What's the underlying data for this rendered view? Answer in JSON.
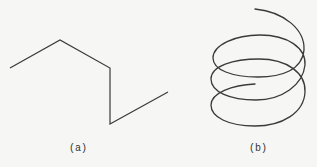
{
  "figures": [
    {
      "id": "a",
      "caption": "(a)",
      "kind": "polyline",
      "points": [
        [
          10,
          68
        ],
        [
          60,
          40
        ],
        [
          110,
          68
        ],
        [
          110,
          124
        ],
        [
          168,
          92
        ]
      ],
      "stroke": "#3a3a3a"
    },
    {
      "id": "b",
      "caption": "(b)",
      "kind": "helix",
      "turns": 3,
      "stroke": "#3a3a3a"
    }
  ],
  "colors": {
    "background": "#f6f6f4",
    "stroke": "#3a3a3a"
  }
}
